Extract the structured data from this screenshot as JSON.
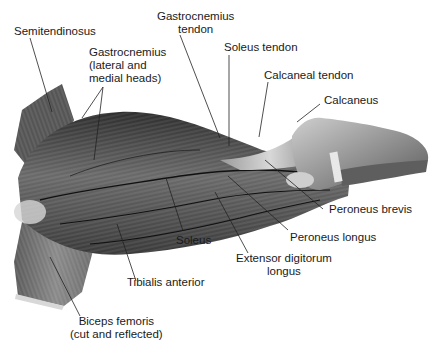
{
  "figure": {
    "labels": [
      {
        "id": "semitendinosus",
        "lines": [
          "Semitendinosus"
        ]
      },
      {
        "id": "gastrocnemius-heads",
        "lines": [
          "Gastrocnemius",
          "(lateral and",
          "medial heads)"
        ]
      },
      {
        "id": "gastrocnemius-tendon",
        "lines": [
          "Gastrocnemius",
          "tendon"
        ]
      },
      {
        "id": "soleus-tendon",
        "lines": [
          "Soleus tendon"
        ]
      },
      {
        "id": "calcaneal-tendon",
        "lines": [
          "Calcaneal tendon"
        ]
      },
      {
        "id": "calcaneus",
        "lines": [
          "Calcaneus"
        ]
      },
      {
        "id": "peroneus-brevis",
        "lines": [
          "Peroneus brevis"
        ]
      },
      {
        "id": "peroneus-longus",
        "lines": [
          "Peroneus longus"
        ]
      },
      {
        "id": "extensor-digitorum-longus",
        "lines": [
          "Extensor digitorum",
          "longus"
        ]
      },
      {
        "id": "soleus",
        "lines": [
          "Soleus"
        ]
      },
      {
        "id": "tibialis-anterior",
        "lines": [
          "Tibialis anterior"
        ]
      },
      {
        "id": "biceps-femoris",
        "lines": [
          "Biceps femoris",
          "(cut and reflected)"
        ]
      }
    ]
  }
}
